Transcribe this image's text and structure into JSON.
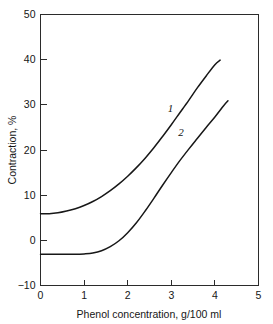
{
  "chart_data": {
    "type": "line",
    "title": "",
    "xlabel": "Phenol concentration, g/100 ml",
    "ylabel": "Contraction, %",
    "xlim": [
      0,
      5
    ],
    "ylim": [
      -10,
      50
    ],
    "xticks": [
      "0",
      "1",
      "2",
      "3",
      "4",
      "5"
    ],
    "xtick_values": [
      0,
      1,
      2,
      3,
      4,
      5
    ],
    "yticks": [
      "50",
      "40",
      "30",
      "20",
      "10",
      "0",
      "-10"
    ],
    "ytick_values": [
      50,
      40,
      30,
      20,
      10,
      0,
      -10
    ],
    "grid": false,
    "legend": "inline-curve-labels",
    "series": [
      {
        "name": "1",
        "label": "1",
        "label_x": 2.98,
        "label_y": 28.5,
        "color": "#171717",
        "x": [
          0.0,
          0.2,
          0.4,
          0.6,
          0.8,
          1.0,
          1.2,
          1.4,
          1.6,
          1.8,
          2.0,
          2.2,
          2.4,
          2.6,
          2.8,
          3.0,
          3.2,
          3.4,
          3.6,
          3.8,
          4.0,
          4.12
        ],
        "y": [
          5.9,
          5.9,
          6.1,
          6.5,
          7.0,
          7.7,
          8.6,
          9.7,
          11.0,
          12.5,
          14.2,
          16.1,
          18.2,
          20.5,
          23.0,
          25.6,
          28.3,
          31.0,
          33.8,
          36.4,
          38.9,
          39.9
        ]
      },
      {
        "name": "2",
        "label": "2",
        "label_x": 3.22,
        "label_y": 23.2,
        "color": "#171717",
        "x": [
          0.0,
          0.2,
          0.4,
          0.6,
          0.8,
          1.0,
          1.2,
          1.4,
          1.6,
          1.8,
          2.0,
          2.2,
          2.4,
          2.6,
          2.8,
          3.0,
          3.2,
          3.4,
          3.6,
          3.8,
          4.0,
          4.2,
          4.3
        ],
        "y": [
          -3.1,
          -3.1,
          -3.1,
          -3.1,
          -3.1,
          -3.0,
          -2.8,
          -2.3,
          -1.4,
          -0.1,
          1.7,
          3.9,
          6.5,
          9.3,
          12.2,
          15.0,
          17.7,
          20.2,
          22.6,
          25.0,
          27.3,
          29.8,
          30.9
        ]
      }
    ]
  },
  "figure": {
    "background_color": "#ffffff",
    "axis_color": "#2b2b2b",
    "curve_color": "#171717"
  }
}
